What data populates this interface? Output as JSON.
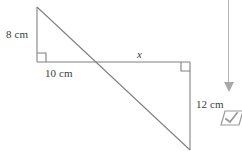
{
  "figure": {
    "name": "similar-triangles-transversal",
    "stroke_color": "#808080",
    "background_color": "#ffffff",
    "labels": {
      "left_vertical_leg": "8 cm",
      "left_horizontal_leg": "10 cm",
      "right_horizontal_leg": "x",
      "right_vertical_leg": "12 cm"
    },
    "geometry": {
      "left_triangle": {
        "apex": [
          37,
          7
        ],
        "right_angle_vertex": [
          37,
          62
        ],
        "base_end": [
          97,
          62
        ],
        "right_angle_marker": true
      },
      "right_triangle": {
        "right_angle_vertex": [
          190,
          62
        ],
        "base_start": [
          97,
          62
        ],
        "bottom_vertex": [
          190,
          150
        ],
        "right_angle_marker": true
      },
      "transversal": {
        "start": [
          37,
          7
        ],
        "end": [
          190,
          150
        ],
        "intersection": [
          97,
          62
        ]
      },
      "horizontal_line": {
        "start": [
          37,
          62
        ],
        "end": [
          190,
          62
        ]
      }
    }
  },
  "right_rail": {
    "scrollbar": {
      "name": "vertical-scrollbar",
      "track_color": "#b6b6b6",
      "arrow_color": "#a8a8a8",
      "arrow_direction": "down"
    },
    "verify_icon": {
      "name": "checkmark-parallelogram-icon",
      "color": "#9a9a9a"
    }
  }
}
